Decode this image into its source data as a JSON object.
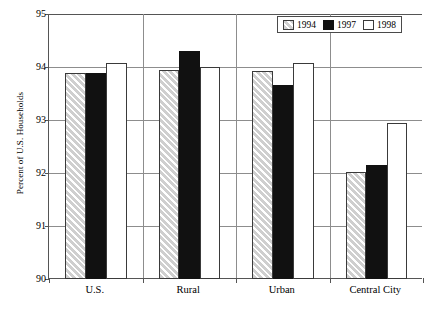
{
  "chart_data": {
    "type": "bar",
    "title": "",
    "xlabel": "",
    "ylabel": "Percent of U.S. Households",
    "ylim": [
      90,
      95
    ],
    "yticks": [
      90,
      91,
      92,
      93,
      94,
      95
    ],
    "grid": true,
    "legend_position": "top-right",
    "categories": [
      "U.S.",
      "Rural",
      "Urban",
      "Central City"
    ],
    "series": [
      {
        "name": "1994",
        "values": [
          93.88,
          93.95,
          93.92,
          92.02
        ]
      },
      {
        "name": "1997",
        "values": [
          93.88,
          94.31,
          93.66,
          92.15
        ]
      },
      {
        "name": "1998",
        "values": [
          94.08,
          94.0,
          94.08,
          92.95
        ]
      }
    ]
  },
  "legend": {
    "entries": [
      {
        "label": "1994",
        "swatch": "hatched-gray"
      },
      {
        "label": "1997",
        "swatch": "solid-black"
      },
      {
        "label": "1998",
        "swatch": "solid-white"
      }
    ]
  },
  "axes": {
    "y_title": "Percent of U.S. Households",
    "y_tick_labels": [
      "95",
      "94",
      "93",
      "92",
      "91",
      "90"
    ],
    "x_tick_labels": [
      "U.S.",
      "Rural",
      "Urban",
      "Central City"
    ]
  },
  "colors": {
    "series_1994": "#cfcfcf",
    "series_1997": "#111111",
    "series_1998": "#ffffff",
    "axis": "#555555",
    "grid": "#8d8d8d"
  }
}
